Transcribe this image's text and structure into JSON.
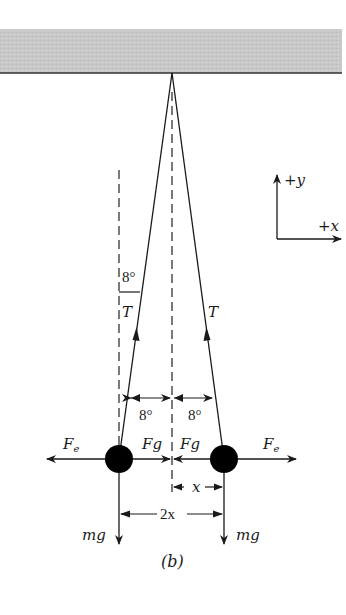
{
  "figure": {
    "caption": "(b)",
    "ceiling": {
      "fill": "#c8c8c8",
      "edge": "#333333"
    },
    "axes": {
      "y_label": "+y",
      "x_label": "+x"
    },
    "labels": {
      "angle_top": "8°",
      "angle_left_bottom": "8°",
      "angle_right_bottom": "8°",
      "tension_left": "T",
      "tension_right": "T",
      "electric_force_left": "F",
      "electric_force_left_sub": "e",
      "electric_force_right": "F",
      "electric_force_right_sub": "e",
      "gravity_force_left": "Fg",
      "gravity_force_right": "Fg",
      "weight_left": "mg",
      "weight_right": "mg",
      "half_separation": "x",
      "separation": "2x"
    },
    "colors": {
      "ink": "#1a1a1a",
      "ball": "#000000"
    }
  }
}
